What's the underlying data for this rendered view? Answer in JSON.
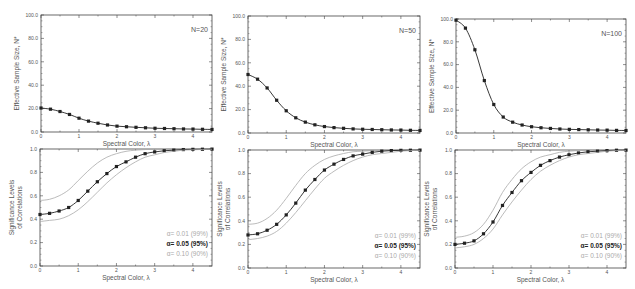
{
  "chart_data": [
    {
      "type": "line",
      "panel": "top-left",
      "title": "",
      "annotation": "N=20",
      "xlabel": "Spectral Color, λ",
      "ylabel": "Effective Sample Size, N*",
      "xlim": [
        0,
        4.5
      ],
      "ylim": [
        0,
        100
      ],
      "xticks": [
        "0",
        "1",
        "2",
        "3",
        "4"
      ],
      "yticks": [
        "0.0",
        "20.0",
        "40.0",
        "60.0",
        "80.0",
        "100.0"
      ],
      "x": [
        0,
        0.25,
        0.5,
        0.75,
        1,
        1.25,
        1.5,
        1.75,
        2,
        2.25,
        2.5,
        2.75,
        3,
        3.25,
        3.5,
        3.75,
        4,
        4.25,
        4.5
      ],
      "series": [
        {
          "name": "N*",
          "values": [
            20.5,
            19.5,
            17.5,
            15,
            11.8,
            9.3,
            7.5,
            6,
            5,
            4.5,
            4,
            3.6,
            3.2,
            3,
            2.8,
            2.6,
            2.5,
            2.3,
            2.2
          ]
        }
      ]
    },
    {
      "type": "line",
      "panel": "top-middle",
      "annotation": "N=50",
      "xlabel": "Spectral Color, λ",
      "ylabel": "Effective Sample Size, N*",
      "xlim": [
        0,
        4.5
      ],
      "ylim": [
        0,
        100
      ],
      "xticks": [
        "0",
        "1",
        "2",
        "3",
        "4"
      ],
      "yticks": [
        "0.0",
        "20.0",
        "40.0",
        "60.0",
        "80.0",
        "100.0"
      ],
      "x": [
        0,
        0.25,
        0.5,
        0.75,
        1,
        1.25,
        1.5,
        1.75,
        2,
        2.25,
        2.5,
        2.75,
        3,
        3.25,
        3.5,
        3.75,
        4,
        4.25,
        4.5
      ],
      "series": [
        {
          "name": "N*",
          "values": [
            50,
            46,
            38.5,
            28,
            19,
            13,
            9.3,
            7,
            5.5,
            4.6,
            4,
            3.5,
            3.2,
            3,
            2.8,
            2.6,
            2.5,
            2.3,
            2.2
          ]
        }
      ]
    },
    {
      "type": "line",
      "panel": "top-right",
      "annotation": "N=100",
      "xlabel": "Spectral Color, λ",
      "ylabel": "Effective Sample Size, N*",
      "xlim": [
        0,
        4.5
      ],
      "ylim": [
        0,
        100
      ],
      "xticks": [
        "0",
        "1",
        "2",
        "3",
        "4"
      ],
      "yticks": [
        "0.0",
        "20.0",
        "40.0",
        "60.0",
        "80.0",
        "100.0"
      ],
      "x": [
        0,
        0.25,
        0.5,
        0.75,
        1,
        1.25,
        1.5,
        1.75,
        2,
        2.25,
        2.5,
        2.75,
        3,
        3.25,
        3.5,
        3.75,
        4,
        4.25,
        4.5
      ],
      "series": [
        {
          "name": "N*",
          "values": [
            99,
            92,
            73,
            46,
            25,
            14,
            9.5,
            7,
            5.5,
            4.6,
            4,
            3.5,
            3.2,
            3,
            2.8,
            2.6,
            2.5,
            2.3,
            2.2
          ]
        }
      ]
    },
    {
      "type": "line",
      "panel": "bottom-left",
      "xlabel": "Spectral Color, λ",
      "ylabel": "Significance Levels of Correlations",
      "xlim": [
        0,
        4.5
      ],
      "ylim": [
        0,
        1
      ],
      "xticks": [
        "0",
        "1",
        "2",
        "3",
        "4"
      ],
      "yticks": [
        "0.0",
        "0.2",
        "0.4",
        "0.6",
        "0.8",
        "1.0"
      ],
      "x": [
        0,
        0.25,
        0.5,
        0.75,
        1,
        1.25,
        1.5,
        1.75,
        2,
        2.25,
        2.5,
        2.75,
        3,
        3.25,
        3.5,
        3.75,
        4,
        4.25,
        4.5
      ],
      "series": [
        {
          "name": "α= 0.01 (99%)",
          "values": [
            0.56,
            0.57,
            0.6,
            0.65,
            0.73,
            0.81,
            0.88,
            0.93,
            0.96,
            0.98,
            0.99,
            0.995,
            0.997,
            0.998,
            0.999,
            0.999,
            1,
            1,
            1
          ]
        },
        {
          "name": "α= 0.05 (95%)",
          "values": [
            0.44,
            0.45,
            0.47,
            0.5,
            0.56,
            0.64,
            0.72,
            0.79,
            0.85,
            0.89,
            0.93,
            0.96,
            0.975,
            0.985,
            0.99,
            0.995,
            0.997,
            0.998,
            0.999
          ]
        },
        {
          "name": "α= 0.10 (90%)",
          "values": [
            0.38,
            0.39,
            0.4,
            0.43,
            0.48,
            0.55,
            0.63,
            0.71,
            0.78,
            0.84,
            0.89,
            0.93,
            0.95,
            0.97,
            0.98,
            0.99,
            0.993,
            0.996,
            0.998
          ]
        }
      ],
      "legend": [
        "α= 0.01 (99%)",
        "α= 0.05 (95%)",
        "α= 0.10 (90%)"
      ]
    },
    {
      "type": "line",
      "panel": "bottom-middle",
      "xlabel": "Spectral Color, λ",
      "ylabel": "Significance Levels of Correlations",
      "xlim": [
        0,
        4.5
      ],
      "ylim": [
        0,
        1
      ],
      "xticks": [
        "0",
        "1",
        "2",
        "3",
        "4"
      ],
      "yticks": [
        "0.0",
        "0.2",
        "0.4",
        "0.6",
        "0.8",
        "1.0"
      ],
      "x": [
        0,
        0.25,
        0.5,
        0.75,
        1,
        1.25,
        1.5,
        1.75,
        2,
        2.25,
        2.5,
        2.75,
        3,
        3.25,
        3.5,
        3.75,
        4,
        4.25,
        4.5
      ],
      "series": [
        {
          "name": "α= 0.01 (99%)",
          "values": [
            0.37,
            0.38,
            0.42,
            0.49,
            0.59,
            0.7,
            0.8,
            0.87,
            0.92,
            0.95,
            0.97,
            0.985,
            0.99,
            0.995,
            0.997,
            0.998,
            0.999,
            1,
            1
          ]
        },
        {
          "name": "α= 0.05 (95%)",
          "values": [
            0.28,
            0.29,
            0.32,
            0.37,
            0.45,
            0.55,
            0.66,
            0.75,
            0.83,
            0.88,
            0.92,
            0.95,
            0.965,
            0.98,
            0.99,
            0.995,
            0.997,
            0.998,
            0.999
          ]
        },
        {
          "name": "α= 0.10 (90%)",
          "values": [
            0.24,
            0.25,
            0.27,
            0.31,
            0.38,
            0.47,
            0.57,
            0.67,
            0.76,
            0.82,
            0.87,
            0.91,
            0.94,
            0.96,
            0.97,
            0.98,
            0.99,
            0.995,
            0.997
          ]
        }
      ],
      "legend": [
        "α= 0.01 (99%)",
        "α= 0.05 (95%)",
        "α= 0.10 (90%)"
      ]
    },
    {
      "type": "line",
      "panel": "bottom-right",
      "xlabel": "Spectral Color, λ",
      "ylabel": "Significance Levels of Correlations",
      "xlim": [
        0,
        4.5
      ],
      "ylim": [
        0,
        1
      ],
      "xticks": [
        "0",
        "1",
        "2",
        "3",
        "4"
      ],
      "yticks": [
        "0.0",
        "0.2",
        "0.4",
        "0.6",
        "0.8",
        "1.0"
      ],
      "x": [
        0,
        0.25,
        0.5,
        0.75,
        1,
        1.25,
        1.5,
        1.75,
        2,
        2.25,
        2.5,
        2.75,
        3,
        3.25,
        3.5,
        3.75,
        4,
        4.25,
        4.5
      ],
      "series": [
        {
          "name": "α= 0.01 (99%)",
          "values": [
            0.26,
            0.27,
            0.3,
            0.37,
            0.49,
            0.64,
            0.75,
            0.84,
            0.9,
            0.94,
            0.96,
            0.98,
            0.99,
            0.995,
            0.997,
            0.998,
            0.999,
            1,
            1
          ]
        },
        {
          "name": "α= 0.05 (95%)",
          "values": [
            0.2,
            0.21,
            0.23,
            0.29,
            0.39,
            0.53,
            0.64,
            0.74,
            0.81,
            0.87,
            0.91,
            0.94,
            0.96,
            0.975,
            0.985,
            0.99,
            0.995,
            0.998,
            0.999
          ]
        },
        {
          "name": "α= 0.10 (90%)",
          "values": [
            0.17,
            0.18,
            0.2,
            0.25,
            0.33,
            0.45,
            0.56,
            0.66,
            0.75,
            0.82,
            0.87,
            0.91,
            0.94,
            0.96,
            0.97,
            0.98,
            0.99,
            0.995,
            0.997
          ]
        }
      ],
      "legend": [
        "α= 0.01 (99%)",
        "α= 0.05 (95%)",
        "α= 0.10 (90%)"
      ]
    }
  ],
  "colors": {
    "main": "#222222",
    "band": "#aaaaaa",
    "axis": "#444444",
    "text": "#555555"
  }
}
